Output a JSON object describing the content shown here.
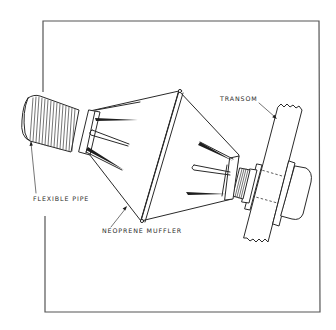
{
  "figure": {
    "type": "technical-line-drawing",
    "colors": {
      "line": "#2a2a2a",
      "frame": "#555555",
      "background": "#ffffff"
    }
  },
  "labels": {
    "flexible_pipe": "FLEXIBLE PIPE",
    "neoprene_muffler": "NEOPRENE MUFFLER",
    "transom": "TRANSOM"
  }
}
